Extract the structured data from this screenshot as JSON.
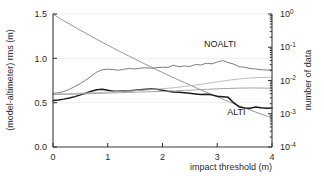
{
  "chart_data": {
    "type": "line",
    "title": "",
    "xlabel": "impact threshold (m)",
    "ylabel_left": "(model-altimeter) rms (m)",
    "ylabel_right": "number of data",
    "xlim": [
      0,
      4
    ],
    "ylim_left": [
      0.0,
      1.5
    ],
    "ylim_right_log": [
      0.0001,
      1
    ],
    "xticks": [
      "0",
      "1",
      "2",
      "3",
      "4"
    ],
    "xtick_values": [
      0,
      1,
      2,
      3,
      4
    ],
    "yticks_left": [
      "0.0",
      "0.5",
      "1.0",
      "1.5"
    ],
    "ytick_values_left": [
      0.0,
      0.5,
      1.0,
      1.5
    ],
    "yticks_right": [
      "10",
      "10",
      "10",
      "10",
      "10"
    ],
    "yticks_right_exp": [
      "0",
      "-1",
      "-2",
      "-3",
      "-4"
    ],
    "ytick_values_right": [
      1,
      0.1,
      0.01,
      0.001,
      0.0001
    ],
    "grid": "light-horizontal",
    "legend_position": "inline-annotations",
    "annotations": [
      {
        "text": "NOALTI",
        "x": 3.05,
        "y": 1.13
      },
      {
        "text": "ALTI",
        "x": 3.35,
        "y": 0.36
      }
    ],
    "series": [
      {
        "name": "number of data (fraction)",
        "color": "#8c8c8c",
        "axis": "right",
        "width": 0.9,
        "x": [
          0.0,
          0.1,
          0.2,
          0.3,
          0.4,
          0.5,
          0.6,
          0.7,
          0.8,
          0.9,
          1.0,
          1.1,
          1.2,
          1.3,
          1.4,
          1.5,
          1.6,
          1.7,
          1.8,
          1.9,
          2.0,
          2.1,
          2.2,
          2.3,
          2.4,
          2.5,
          2.6,
          2.7,
          2.8,
          2.9,
          3.0,
          3.1,
          3.2,
          3.3,
          3.4,
          3.5,
          3.6,
          3.7,
          3.8,
          3.9,
          4.0
        ],
        "values": [
          1.0,
          0.78,
          0.62,
          0.5,
          0.4,
          0.325,
          0.263,
          0.213,
          0.173,
          0.141,
          0.115,
          0.0945,
          0.0778,
          0.0641,
          0.0529,
          0.0438,
          0.0363,
          0.0301,
          0.025,
          0.0208,
          0.0174,
          0.0146,
          0.0122,
          0.0103,
          0.00865,
          0.0073,
          0.00617,
          0.00523,
          0.00444,
          0.00378,
          0.00322,
          0.00275,
          0.00236,
          0.00202,
          0.00174,
          0.0015,
          0.0013,
          0.00112,
          0.00098,
          0.00086,
          0.00075
        ]
      },
      {
        "name": "NOALTI rms",
        "color": "#6e6e6e",
        "axis": "left",
        "width": 0.9,
        "x": [
          0.0,
          0.1,
          0.2,
          0.3,
          0.4,
          0.5,
          0.6,
          0.7,
          0.8,
          0.9,
          1.0,
          1.1,
          1.2,
          1.3,
          1.4,
          1.5,
          1.6,
          1.7,
          1.8,
          1.9,
          2.0,
          2.1,
          2.2,
          2.3,
          2.4,
          2.5,
          2.6,
          2.7,
          2.8,
          2.9,
          3.0,
          3.1,
          3.2,
          3.3,
          3.4,
          3.5,
          3.6,
          3.7,
          3.8,
          3.9,
          4.0
        ],
        "values": [
          0.605,
          0.612,
          0.625,
          0.65,
          0.682,
          0.715,
          0.755,
          0.8,
          0.845,
          0.872,
          0.878,
          0.872,
          0.866,
          0.878,
          0.885,
          0.88,
          0.89,
          0.893,
          0.888,
          0.895,
          0.9,
          0.898,
          0.922,
          0.905,
          0.915,
          0.908,
          0.93,
          0.925,
          0.945,
          0.938,
          0.958,
          0.975,
          0.952,
          0.935,
          0.905,
          0.9,
          0.885,
          0.88,
          0.872,
          0.868,
          0.87
        ]
      },
      {
        "name": "ALTI rms",
        "color": "#1a1a1a",
        "axis": "left",
        "width": 1.5,
        "x": [
          0.0,
          0.1,
          0.2,
          0.3,
          0.4,
          0.5,
          0.6,
          0.7,
          0.8,
          0.9,
          1.0,
          1.1,
          1.2,
          1.3,
          1.4,
          1.5,
          1.6,
          1.7,
          1.8,
          1.9,
          2.0,
          2.1,
          2.2,
          2.3,
          2.4,
          2.5,
          2.6,
          2.7,
          2.8,
          2.9,
          3.0,
          3.1,
          3.2,
          3.3,
          3.4,
          3.5,
          3.6,
          3.7,
          3.8,
          3.9,
          4.0
        ],
        "values": [
          0.525,
          0.53,
          0.54,
          0.552,
          0.568,
          0.588,
          0.608,
          0.628,
          0.645,
          0.652,
          0.64,
          0.63,
          0.628,
          0.632,
          0.635,
          0.64,
          0.645,
          0.652,
          0.655,
          0.65,
          0.64,
          0.628,
          0.62,
          0.618,
          0.612,
          0.605,
          0.598,
          0.592,
          0.595,
          0.588,
          0.572,
          0.568,
          0.56,
          0.5,
          0.452,
          0.44,
          0.438,
          0.45,
          0.442,
          0.438,
          0.44
        ]
      },
      {
        "name": "NOALTI auxiliary",
        "color": "#b4b4b4",
        "axis": "left",
        "width": 0.9,
        "x": [
          0.0,
          0.2,
          0.4,
          0.6,
          0.8,
          1.0,
          1.2,
          1.4,
          1.6,
          1.8,
          2.0,
          2.2,
          2.4,
          2.6,
          2.8,
          3.0,
          3.2,
          3.4,
          3.6,
          3.8,
          4.0
        ],
        "values": [
          0.598,
          0.6,
          0.604,
          0.608,
          0.615,
          0.62,
          0.626,
          0.632,
          0.64,
          0.648,
          0.658,
          0.668,
          0.682,
          0.698,
          0.716,
          0.735,
          0.752,
          0.768,
          0.778,
          0.784,
          0.788
        ]
      },
      {
        "name": "ALTI auxiliary",
        "color": "#9a9a9a",
        "axis": "left",
        "width": 0.9,
        "x": [
          0.0,
          0.2,
          0.4,
          0.6,
          0.8,
          1.0,
          1.2,
          1.4,
          1.6,
          1.8,
          2.0,
          2.2,
          2.4,
          2.6,
          2.8,
          3.0,
          3.2,
          3.4,
          3.6,
          3.8,
          4.0
        ],
        "values": [
          0.592,
          0.594,
          0.596,
          0.6,
          0.604,
          0.608,
          0.612,
          0.616,
          0.62,
          0.624,
          0.628,
          0.632,
          0.638,
          0.644,
          0.65,
          0.656,
          0.66,
          0.664,
          0.666,
          0.665,
          0.662
        ]
      }
    ]
  }
}
